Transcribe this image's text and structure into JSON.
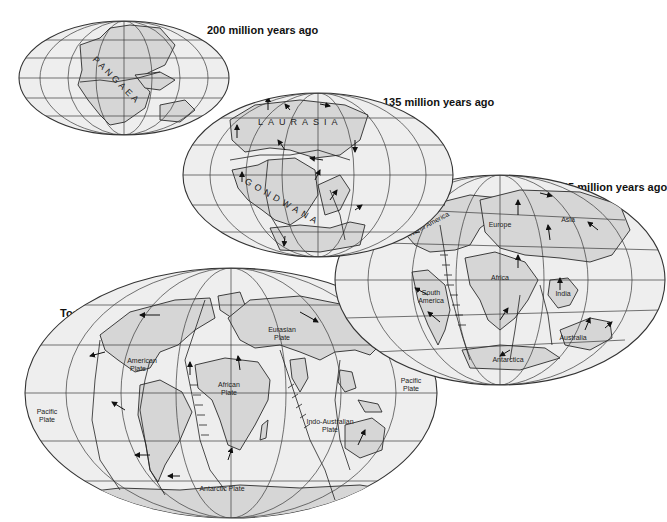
{
  "figure": {
    "colors": {
      "ocean": "#eeeeee",
      "land": "#d6d6d6",
      "lines": "#2a2a2a",
      "background": "#ffffff"
    }
  },
  "maps": [
    {
      "id": "map-200",
      "title": "200 million years ago",
      "labels": [
        "PANGAEA"
      ]
    },
    {
      "id": "map-135",
      "title": "135 million years ago",
      "labels": [
        "LAURASIA",
        "GONDWANA"
      ]
    },
    {
      "id": "map-65",
      "title": "65 million years ago",
      "labels": [
        "North America",
        "Europe",
        "Asia",
        "Africa",
        "South America",
        "India",
        "Australia",
        "Antarctica"
      ]
    },
    {
      "id": "map-today",
      "title": "Today",
      "labels": [
        "Eurasian Plate",
        "American Plate",
        "African Plate",
        "Pacific Plate",
        "Pacific Plate",
        "Indo-Australian Plate",
        "Antarctic Plate"
      ]
    }
  ],
  "labels": {
    "pangaea": "PANGAEA",
    "laurasia": "LAURASIA",
    "gondwana": "GONDWANA",
    "north_america": "North America",
    "europe": "Europe",
    "asia": "Asia",
    "africa": "Africa",
    "south_america_1": "South",
    "south_america_2": "America",
    "india": "India",
    "australia": "Australia",
    "antarctica": "Antarctica",
    "eurasian_1": "Eurasian",
    "eurasian_2": "Plate",
    "american_1": "American",
    "american_2": "Plate",
    "african_1": "African",
    "african_2": "Plate",
    "pacific_w_1": "Pacific",
    "pacific_w_2": "Plate",
    "pacific_e_1": "Pacific",
    "pacific_e_2": "Plate",
    "indo_1": "Indo-Australian",
    "indo_2": "Plate",
    "antarctic": "Antarctic Plate"
  }
}
